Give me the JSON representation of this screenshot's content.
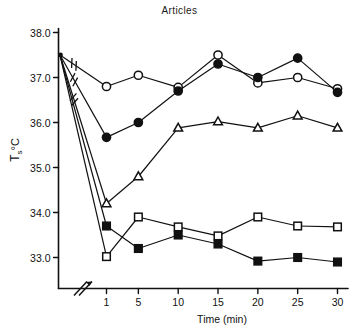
{
  "chart_data": {
    "type": "line",
    "title": "Articles",
    "xlabel": "Time (min)",
    "ylabel": "Ts °C",
    "ylabel_parts": {
      "main": "T",
      "subscript": "s",
      "unit": "°C"
    },
    "x": [
      0,
      1,
      5,
      10,
      15,
      20,
      25,
      30
    ],
    "xtick_labels": [
      "1",
      "5",
      "10",
      "15",
      "20",
      "25",
      "30"
    ],
    "xtick_values": [
      1,
      5,
      10,
      15,
      20,
      25,
      30
    ],
    "ytick_labels": [
      "38.0",
      "37.0",
      "36.0",
      "35.0",
      "34.0",
      "33.0"
    ],
    "ytick_values": [
      38.0,
      37.0,
      36.0,
      35.0,
      34.0,
      33.0
    ],
    "ylim": [
      32.3,
      38.0
    ],
    "grid": false,
    "legend": "none",
    "axis_break": true,
    "axis_break_note": "diagonal break hatch on x-axis between 0 and 1 min",
    "line_break_marks": 3,
    "origin_value": 37.5,
    "series": [
      {
        "name": "open-circle",
        "marker": "open-circle",
        "values": [
          37.5,
          36.8,
          37.05,
          36.78,
          37.5,
          36.88,
          37.0,
          36.75
        ],
        "has_break_mark": true
      },
      {
        "name": "filled-circle",
        "marker": "filled-circle",
        "values": [
          37.5,
          35.67,
          36.0,
          36.7,
          37.3,
          37.0,
          37.43,
          36.67
        ],
        "has_break_mark": true
      },
      {
        "name": "open-triangle",
        "marker": "open-triangle",
        "values": [
          37.5,
          34.2,
          34.8,
          35.88,
          36.02,
          35.88,
          36.15,
          35.88
        ],
        "has_break_mark": true
      },
      {
        "name": "open-square",
        "marker": "open-square",
        "values": [
          37.5,
          33.02,
          33.9,
          33.68,
          33.48,
          33.9,
          33.7,
          33.68
        ],
        "has_break_mark": false
      },
      {
        "name": "filled-square",
        "marker": "filled-square",
        "values": [
          37.5,
          33.7,
          33.2,
          33.5,
          33.3,
          32.92,
          33.0,
          32.9
        ],
        "has_break_mark": false
      }
    ],
    "colors": {
      "ink": "#111111",
      "background": "#ffffff"
    }
  }
}
